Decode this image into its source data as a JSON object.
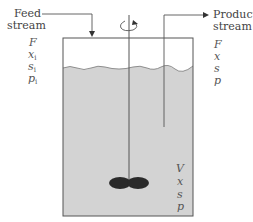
{
  "diagram": {
    "type": "continuous stirred tank bioreactor (chemostat)",
    "feed": {
      "label_line1": "Feed",
      "label_line2": "stream",
      "variables": [
        {
          "sym": "F",
          "sub": ""
        },
        {
          "sym": "x",
          "sub": "i"
        },
        {
          "sym": "s",
          "sub": "i"
        },
        {
          "sym": "p",
          "sub": "i"
        }
      ]
    },
    "product": {
      "label_line1": "Product",
      "label_line2": "stream",
      "variables": [
        {
          "sym": "F",
          "sub": ""
        },
        {
          "sym": "x",
          "sub": ""
        },
        {
          "sym": "s",
          "sub": ""
        },
        {
          "sym": "p",
          "sub": ""
        }
      ]
    },
    "reactor": {
      "variables": [
        {
          "sym": "V",
          "sub": ""
        },
        {
          "sym": "x",
          "sub": ""
        },
        {
          "sym": "s",
          "sub": ""
        },
        {
          "sym": "p",
          "sub": ""
        }
      ]
    },
    "colors": {
      "liquid": "#d3d3d3",
      "line": "#555555",
      "impeller": "#2a2a2a",
      "text": "#444444"
    }
  }
}
